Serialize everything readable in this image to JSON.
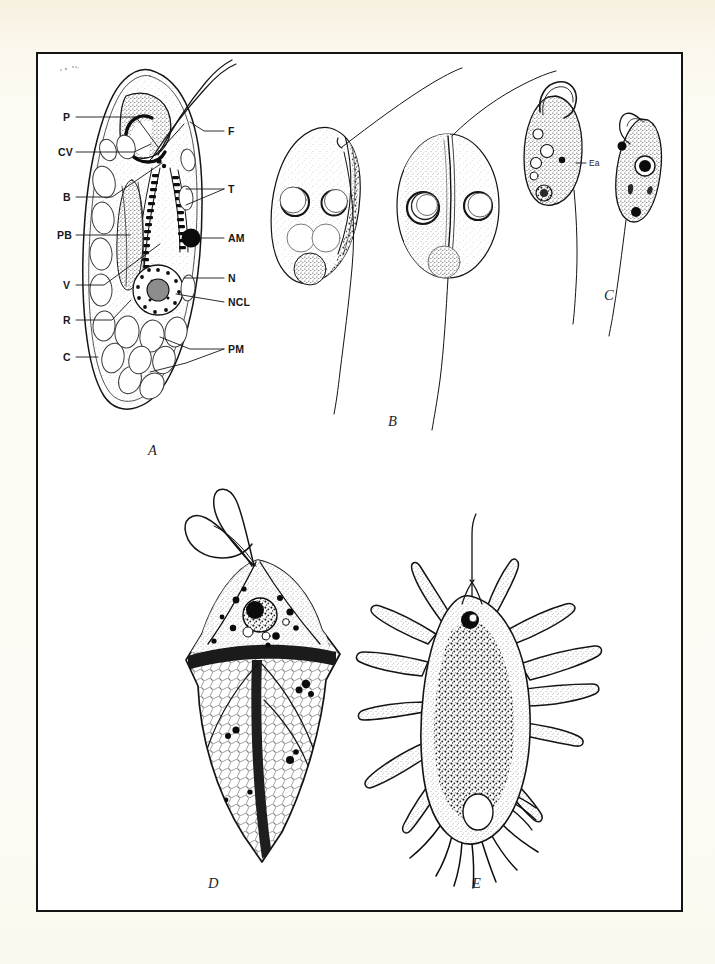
{
  "page": {
    "background_color": "#fbf8ee",
    "plate_background": "#ffffff",
    "frame_color": "#141414",
    "ink_color": "#141414"
  },
  "plate": {
    "title": "",
    "panels": [
      {
        "letter": "A",
        "name": "euglenoid-flagellate-diagram",
        "description": "Labeled schematic of a euglenoid flagellate in longitudinal section"
      },
      {
        "letter": "B",
        "name": "paired-oval-flagellates",
        "description": "Two stippled ovoid flagellate cells each with a long trailing flagellum"
      },
      {
        "letter": "C",
        "name": "small-flagellate-pair",
        "description": "Two small stippled flagellates, the left ovoid with a hooked anterior flagellum, the right elongate and twisted"
      },
      {
        "letter": "D",
        "name": "armoured-dinoflagellate",
        "description": "Angular armoured cell with girdle and looping flagella"
      },
      {
        "letter": "E",
        "name": "amoeboid-heliozoan",
        "description": "Granular amoeboid cell with radiating tapered pseudopodia and a single anterior flagellum"
      }
    ],
    "labels_panel_a_left": [
      {
        "key": "P",
        "text": "P",
        "name": "label-p"
      },
      {
        "key": "CV",
        "text": "CV",
        "name": "label-cv"
      },
      {
        "key": "B",
        "text": "B",
        "name": "label-b"
      },
      {
        "key": "PB",
        "text": "PB",
        "name": "label-pb"
      },
      {
        "key": "V",
        "text": "V",
        "name": "label-v"
      },
      {
        "key": "R",
        "text": "R",
        "name": "label-r"
      },
      {
        "key": "C",
        "text": "C",
        "name": "label-c"
      }
    ],
    "labels_panel_a_right": [
      {
        "key": "F",
        "text": "F",
        "name": "label-f"
      },
      {
        "key": "T",
        "text": "T",
        "name": "label-t"
      },
      {
        "key": "AM",
        "text": "AM",
        "name": "label-am"
      },
      {
        "key": "N",
        "text": "N",
        "name": "label-n"
      },
      {
        "key": "NCL",
        "text": "NCL",
        "name": "label-ncl"
      },
      {
        "key": "PM",
        "text": "PM",
        "name": "label-pm"
      }
    ],
    "labels_panel_c": [
      {
        "key": "Ea",
        "text": "Ea",
        "name": "label-ea"
      }
    ]
  }
}
